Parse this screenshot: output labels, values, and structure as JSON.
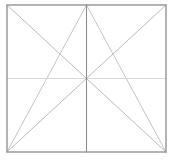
{
  "figure": {
    "name": "rectangle-with-diagonals-and-midlines",
    "canvas": {
      "width": 173,
      "height": 162,
      "background": "#ffffff"
    },
    "frame": {
      "label": "outer-rectangle",
      "x": 7,
      "y": 5,
      "width": 159,
      "height": 147,
      "left": 7,
      "top": 5,
      "right": 166,
      "bottom": 152,
      "stroke": "#949494",
      "stroke_width": 1.4,
      "fill": "none"
    },
    "center_point": {
      "x": 86.5,
      "y": 78.5
    },
    "colors": {
      "frame_stroke": "#949494",
      "vertical_midline_stroke": "#8e8e8e",
      "horizontal_midline_stroke": "#d8d8d8",
      "diagonal_stroke": "#b4b4b4",
      "fan_stroke": "#bdbdbd",
      "background": "#ffffff"
    },
    "midlines": [
      {
        "label": "vertical-midline",
        "x1": 86.5,
        "y1": 5,
        "x2": 86.5,
        "y2": 152,
        "stroke": "#8e8e8e",
        "stroke_width": 1.1
      },
      {
        "label": "horizontal-midline",
        "x1": 7,
        "y1": 78.5,
        "x2": 166,
        "y2": 78.5,
        "stroke": "#d8d8d8",
        "stroke_width": 1.0
      }
    ],
    "diagonals": [
      {
        "label": "diagonal-topleft-to-bottomright",
        "x1": 7,
        "y1": 5,
        "x2": 166,
        "y2": 152,
        "stroke": "#b4b4b4",
        "stroke_width": 0.9
      },
      {
        "label": "diagonal-topright-to-bottomleft",
        "x1": 166,
        "y1": 5,
        "x2": 7,
        "y2": 152,
        "stroke": "#b4b4b4",
        "stroke_width": 0.9
      }
    ],
    "fan_lines": [
      {
        "label": "topcenter-to-bottomleft",
        "x1": 86.5,
        "y1": 5,
        "x2": 7,
        "y2": 152,
        "stroke": "#bdbdbd",
        "stroke_width": 0.9
      },
      {
        "label": "topcenter-to-bottomright",
        "x1": 86.5,
        "y1": 5,
        "x2": 166,
        "y2": 152,
        "stroke": "#bdbdbd",
        "stroke_width": 0.9
      }
    ]
  }
}
